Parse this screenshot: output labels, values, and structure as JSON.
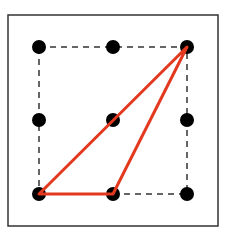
{
  "diagram": {
    "frame": {
      "x": 8,
      "y": 15,
      "width": 210,
      "height": 211,
      "stroke": "#333333"
    },
    "grid": {
      "xs": [
        39,
        113,
        187
      ],
      "ys": [
        47,
        120,
        194
      ],
      "dot_radius": 7,
      "dot_color": "#000000"
    },
    "dashed_square": {
      "x1": 39,
      "y1": 47,
      "x2": 187,
      "y2": 194,
      "stroke": "#333333"
    },
    "triangle": {
      "points": [
        [
          39,
          194
        ],
        [
          113,
          194
        ],
        [
          187,
          47
        ]
      ],
      "stroke": "#e2391f"
    }
  }
}
